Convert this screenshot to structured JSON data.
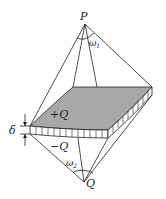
{
  "diagram": {
    "labels": {
      "top_point": "P",
      "bottom_point": "Q",
      "top_angle": "ω",
      "top_angle_sub": "1",
      "bottom_angle": "ω",
      "bottom_angle_sub": "2",
      "positive_charge": "+Q",
      "negative_charge": "−Q",
      "thickness": "δ"
    },
    "colors": {
      "line": "#222222",
      "shaded_face": "#a8a8a8"
    }
  }
}
